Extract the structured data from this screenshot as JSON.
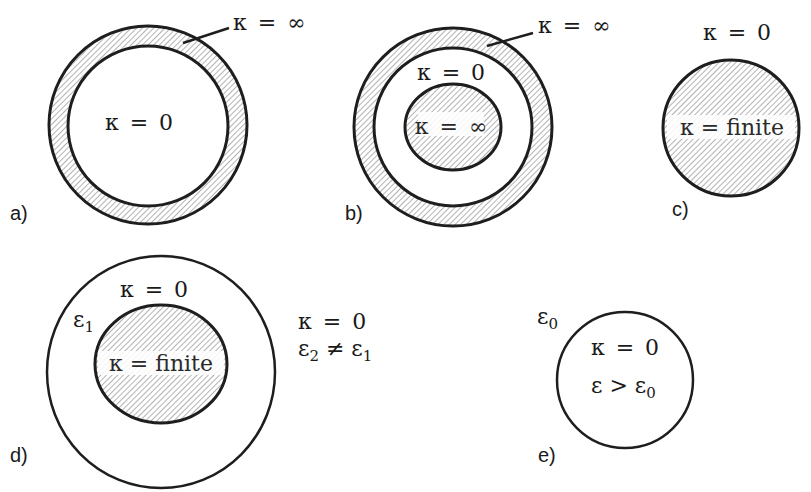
{
  "figure": {
    "colors": {
      "stroke": "#1e1e1e",
      "hatch": "#8a8a8a",
      "hatch_bg": "#ffffff",
      "text": "#1a1a1a"
    },
    "panels": [
      {
        "id": "a",
        "label": "a)",
        "outer_shell_label": "κ = ∞",
        "interior_label": "κ = 0"
      },
      {
        "id": "b",
        "label": "b)",
        "outer_shell_label": "κ = ∞",
        "gap_label": "κ = 0",
        "core_label": "κ = ∞"
      },
      {
        "id": "c",
        "label": "c)",
        "exterior_label": "κ = 0",
        "body_label": "κ = finite"
      },
      {
        "id": "d",
        "label": "d)",
        "shell_label": "κ = 0",
        "shell_permittivity": "ε",
        "shell_permittivity_sub": "1",
        "core_label": "κ = finite",
        "exterior_conductivity": "κ = 0",
        "exterior_permittivity": "ε",
        "exterior_permittivity_sub": "2",
        "exterior_relation": " ≠ ε",
        "exterior_relation_sub": "1"
      },
      {
        "id": "e",
        "label": "e)",
        "exterior_permittivity": "ε",
        "exterior_permittivity_sub": "0",
        "interior_conductivity": "κ = 0",
        "interior_relation": "ε > ε",
        "interior_relation_sub": "0"
      }
    ]
  }
}
